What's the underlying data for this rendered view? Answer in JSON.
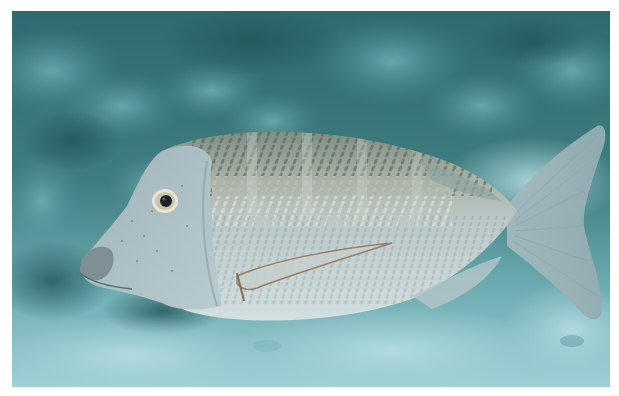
{
  "page": {
    "background": "#ffffff"
  },
  "photo": {
    "subject": "fish",
    "description": "Silver-grey striped emperor fish swimming left over a coral reef and sandy bottom",
    "frame": {
      "x": 12,
      "y": 11,
      "width": 598,
      "height": 376
    },
    "colors": {
      "reef_dark": "#2f6a6e",
      "reef_mid": "#4a8c8f",
      "reef_light": "#6fb0b3",
      "sand": "#9fd0d6",
      "sand_light": "#b5dde2",
      "fish_body": "#b9c9cc",
      "fish_belly": "#d3dfe0",
      "fish_scales_dark": "#5d6a5e",
      "fish_scales_light": "#e0dcc8",
      "fish_head": "#a9bfc6",
      "eye_ring": "#e8e4cf",
      "pupil": "#1c2224"
    }
  }
}
